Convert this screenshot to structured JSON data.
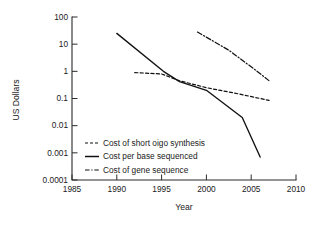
{
  "chart_data": {
    "type": "line",
    "title": "",
    "xlabel": "Year",
    "ylabel": "US Dollars",
    "yscale": "log",
    "xlim": [
      1985,
      2010
    ],
    "ylim": [
      0.0001,
      100
    ],
    "grid": false,
    "legend_position": "lower-left-inside",
    "xticks": [
      "1985",
      "1990",
      "1995",
      "2000",
      "2005",
      "2010"
    ],
    "xtick_values": [
      1985,
      1990,
      1995,
      2000,
      2005,
      2010
    ],
    "yticks": [
      "100",
      "10",
      "1",
      "0.1",
      "0.01",
      "0.001",
      "0.0001"
    ],
    "ytick_values": [
      100,
      10,
      1,
      0.1,
      0.01,
      0.001,
      0.0001
    ],
    "series": [
      {
        "name": "Cost of short oigo synthesis",
        "style": "dashed",
        "color": "#111111",
        "x": [
          1992.0,
          1995.0,
          1997.0,
          2000.0,
          2003.5,
          2007.0
        ],
        "values": [
          0.9,
          0.8,
          0.45,
          0.25,
          0.15,
          0.085
        ]
      },
      {
        "name": "Cost per base sequenced",
        "style": "solid",
        "color": "#111111",
        "x": [
          1990.0,
          1995.2,
          1997.0,
          2000.0,
          2004.0,
          2006.0
        ],
        "values": [
          25,
          1.0,
          0.42,
          0.2,
          0.02,
          0.0007
        ]
      },
      {
        "name": "Cost of gene sequence",
        "style": "dashdot",
        "color": "#111111",
        "x": [
          1999.0,
          2002.5,
          2005.5,
          2007.0
        ],
        "values": [
          28,
          6.0,
          1.1,
          0.45
        ]
      }
    ]
  },
  "legend": {
    "entries": [
      {
        "label": "Cost of short oigo synthesis"
      },
      {
        "label": "Cost per base sequenced"
      },
      {
        "label": "Cost of gene sequence"
      }
    ]
  },
  "axes": {
    "x_title": "Year",
    "y_title": "US Dollars"
  }
}
